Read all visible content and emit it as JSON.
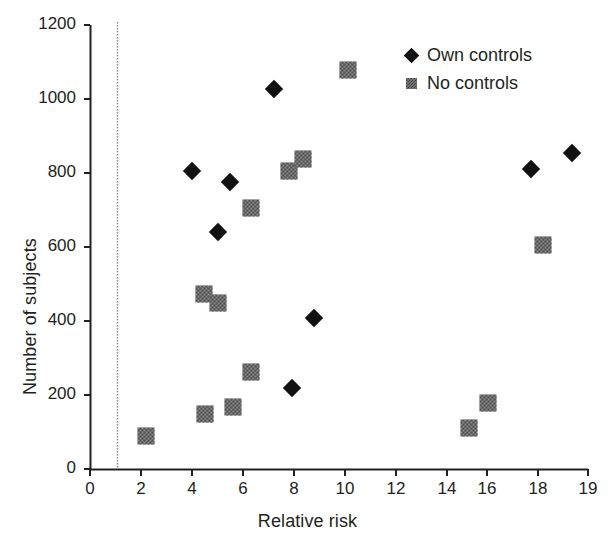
{
  "chart_data": {
    "type": "scatter",
    "title": "",
    "xlabel": "Relative risk",
    "ylabel": "Number of subjects",
    "xlim": [
      0,
      19
    ],
    "ylim": [
      0,
      1200
    ],
    "grid": false,
    "legend_position": "top-right",
    "xticks": [
      "0",
      "2",
      "4",
      "6",
      "8",
      "10",
      "12",
      "14",
      "16",
      "18",
      "19"
    ],
    "yticks": [
      "0",
      "200",
      "400",
      "600",
      "800",
      "1000",
      "1200"
    ],
    "reference_line": {
      "axis": "x",
      "value": 1,
      "style": "dotted"
    },
    "series": [
      {
        "name": "Own controls",
        "marker": "diamond",
        "color": "#111111",
        "points": [
          {
            "x": 4.0,
            "y": 805
          },
          {
            "x": 5.5,
            "y": 777
          },
          {
            "x": 5.0,
            "y": 641
          },
          {
            "x": 7.2,
            "y": 1028
          },
          {
            "x": 8.8,
            "y": 407
          },
          {
            "x": 7.9,
            "y": 220
          },
          {
            "x": 17.3,
            "y": 812
          },
          {
            "x": 18.6,
            "y": 855
          }
        ]
      },
      {
        "name": "No controls",
        "marker": "square",
        "color": "#8d8d8d",
        "points": [
          {
            "x": 2.2,
            "y": 88
          },
          {
            "x": 4.5,
            "y": 148
          },
          {
            "x": 4.45,
            "y": 472
          },
          {
            "x": 5.0,
            "y": 448
          },
          {
            "x": 5.6,
            "y": 168
          },
          {
            "x": 6.3,
            "y": 262
          },
          {
            "x": 6.3,
            "y": 705
          },
          {
            "x": 7.8,
            "y": 805
          },
          {
            "x": 8.35,
            "y": 838
          },
          {
            "x": 10.1,
            "y": 1078
          },
          {
            "x": 14.85,
            "y": 112
          },
          {
            "x": 15.6,
            "y": 178
          },
          {
            "x": 17.75,
            "y": 606
          }
        ]
      }
    ]
  },
  "legend": {
    "items": [
      {
        "label": "Own controls",
        "marker": "diamond"
      },
      {
        "label": "No controls",
        "marker": "square"
      }
    ]
  }
}
